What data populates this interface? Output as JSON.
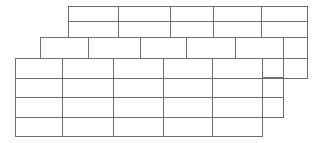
{
  "canvas": {
    "width": 327,
    "height": 143,
    "background_color": "#ffffff",
    "line_color": "#6e6e6e",
    "line_color_light": "#9a9a9a",
    "line_width": 1,
    "cell_fill": "#ffffff"
  },
  "diagram": {
    "title": "",
    "layer_count": 3
  },
  "layers": [
    {
      "id": "layer-top",
      "name": "top-grid-layer",
      "z": 1,
      "x": 68,
      "y": 6,
      "width": 239,
      "height": 31,
      "rows": 2,
      "columns": 5,
      "row_boundaries": [
        6,
        21,
        37
      ],
      "column_boundaries": [
        68,
        118,
        170,
        213,
        261,
        307
      ],
      "cell_labels": [
        [
          "",
          "",
          "",
          "",
          ""
        ],
        [
          "",
          "",
          "",
          "",
          ""
        ]
      ]
    },
    {
      "id": "layer-middle",
      "name": "middle-grid-layer",
      "z": 2,
      "x": 40,
      "y": 37,
      "width": 243,
      "height": 21,
      "rows": 1,
      "columns": 5,
      "row_boundaries": [
        37,
        58
      ],
      "column_boundaries": [
        40,
        88,
        140,
        186,
        235,
        283
      ],
      "cell_labels": [
        [
          "",
          "",
          "",
          "",
          ""
        ]
      ]
    },
    {
      "id": "layer-bottom",
      "name": "bottom-grid-layer",
      "z": 3,
      "x": 15,
      "y": 58,
      "width": 247,
      "height": 78,
      "rows": 4,
      "columns": 5,
      "row_boundaries": [
        58,
        78,
        97,
        117,
        136
      ],
      "column_boundaries": [
        15,
        62,
        113,
        163,
        212,
        262
      ],
      "cell_labels": [
        [
          "",
          "",
          "",
          "",
          ""
        ],
        [
          "",
          "",
          "",
          "",
          ""
        ],
        [
          "",
          "",
          "",
          "",
          ""
        ],
        [
          "",
          "",
          "",
          "",
          ""
        ]
      ]
    }
  ],
  "right_step_cells": [
    {
      "id": "step-cell-a",
      "name": "right-step-cell-upper",
      "x": 283,
      "y": 37,
      "width": 24,
      "height": 21
    },
    {
      "id": "step-cell-b",
      "name": "right-step-cell-middle",
      "x": 283,
      "y": 58,
      "width": 24,
      "height": 20
    },
    {
      "id": "step-cell-c",
      "name": "right-step-cell-bottom-outer",
      "x": 262,
      "y": 58,
      "width": 21,
      "height": 19
    },
    {
      "id": "step-cell-d",
      "name": "right-step-cell-second",
      "x": 262,
      "y": 78,
      "width": 21,
      "height": 19
    },
    {
      "id": "step-cell-e",
      "name": "right-step-cell-third",
      "x": 262,
      "y": 97,
      "width": 21,
      "height": 20
    }
  ]
}
